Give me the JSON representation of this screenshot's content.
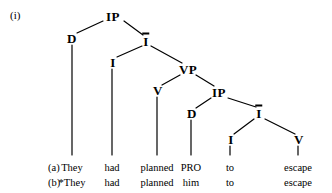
{
  "figure": {
    "example_number": "(i)",
    "background_color": "#ffffff",
    "line_color": "#000000",
    "text_color": "#000000"
  },
  "tree": {
    "nodes": [
      {
        "id": "ip1",
        "label": "IP",
        "bar": false,
        "x": 113,
        "y": 16
      },
      {
        "id": "d1",
        "label": "D",
        "bar": false,
        "x": 72,
        "y": 38
      },
      {
        "id": "ibar1",
        "label": "I",
        "bar": true,
        "x": 146,
        "y": 41
      },
      {
        "id": "i1",
        "label": "I",
        "bar": false,
        "x": 113,
        "y": 62
      },
      {
        "id": "vp",
        "label": "VP",
        "bar": false,
        "x": 188,
        "y": 69
      },
      {
        "id": "v1",
        "label": "V",
        "bar": false,
        "x": 158,
        "y": 90
      },
      {
        "id": "ip2",
        "label": "IP",
        "bar": false,
        "x": 219,
        "y": 92
      },
      {
        "id": "d2",
        "label": "D",
        "bar": false,
        "x": 192,
        "y": 113
      },
      {
        "id": "ibar2",
        "label": "I",
        "bar": true,
        "x": 259,
        "y": 113
      },
      {
        "id": "i2",
        "label": "I",
        "bar": false,
        "x": 231,
        "y": 139
      },
      {
        "id": "v2",
        "label": "V",
        "bar": false,
        "x": 299,
        "y": 139
      }
    ],
    "edges": [
      {
        "from": "ip1",
        "to": "d1",
        "x1": 103,
        "y1": 21,
        "x2": 77,
        "y2": 33
      },
      {
        "from": "ip1",
        "to": "ibar1",
        "x1": 124,
        "y1": 21,
        "x2": 143,
        "y2": 35
      },
      {
        "from": "ibar1",
        "to": "i1",
        "x1": 142,
        "y1": 46,
        "x2": 117,
        "y2": 57
      },
      {
        "from": "ibar1",
        "to": "vp",
        "x1": 151,
        "y1": 46,
        "x2": 182,
        "y2": 63
      },
      {
        "from": "vp",
        "to": "v1",
        "x1": 180,
        "y1": 75,
        "x2": 162,
        "y2": 85
      },
      {
        "from": "vp",
        "to": "ip2",
        "x1": 196,
        "y1": 75,
        "x2": 214,
        "y2": 86
      },
      {
        "from": "ip2",
        "to": "d2",
        "x1": 211,
        "y1": 98,
        "x2": 196,
        "y2": 108
      },
      {
        "from": "ip2",
        "to": "ibar2",
        "x1": 228,
        "y1": 98,
        "x2": 256,
        "y2": 107
      },
      {
        "from": "ibar2",
        "to": "i2",
        "x1": 254,
        "y1": 119,
        "x2": 234,
        "y2": 134
      },
      {
        "from": "ibar2",
        "to": "v2",
        "x1": 265,
        "y1": 119,
        "x2": 295,
        "y2": 134
      }
    ],
    "drop_lines": [
      {
        "from": "d1",
        "x1": 72,
        "y1": 45,
        "x2": 72,
        "y2": 155
      },
      {
        "from": "i1",
        "x1": 112,
        "y1": 69,
        "x2": 112,
        "y2": 155
      },
      {
        "from": "v1",
        "x1": 157,
        "y1": 97,
        "x2": 157,
        "y2": 155
      },
      {
        "from": "d2",
        "x1": 191,
        "y1": 120,
        "x2": 191,
        "y2": 155
      },
      {
        "from": "i2",
        "x1": 230,
        "y1": 146,
        "x2": 230,
        "y2": 155
      },
      {
        "from": "v2",
        "x1": 298,
        "y1": 146,
        "x2": 298,
        "y2": 155
      }
    ]
  },
  "sentences": {
    "row_label_x": 48,
    "rows": [
      {
        "label": "(a)",
        "y": 168,
        "words": [
          {
            "text": "They",
            "x": 72
          },
          {
            "text": "had",
            "x": 112
          },
          {
            "text": "planned",
            "x": 157
          },
          {
            "text": "PRO",
            "x": 191
          },
          {
            "text": "to",
            "x": 230
          },
          {
            "text": "escape",
            "x": 298
          }
        ]
      },
      {
        "label": "(b)",
        "y": 183,
        "words": [
          {
            "text": "*They",
            "x": 72
          },
          {
            "text": "had",
            "x": 112
          },
          {
            "text": "planned",
            "x": 157
          },
          {
            "text": "him",
            "x": 191
          },
          {
            "text": "to",
            "x": 230
          },
          {
            "text": "escape",
            "x": 298
          }
        ]
      }
    ]
  }
}
